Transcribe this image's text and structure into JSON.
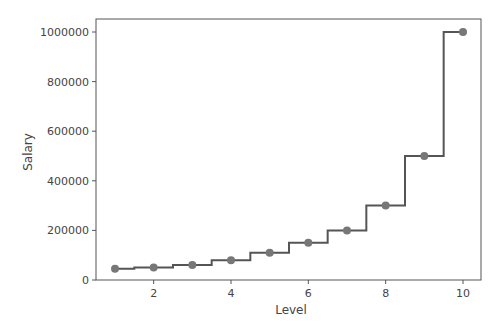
{
  "chart_data": {
    "type": "line",
    "subtype": "step-with-markers",
    "title": "",
    "xlabel": "Level",
    "ylabel": "Salary",
    "x": [
      1,
      2,
      3,
      4,
      5,
      6,
      7,
      8,
      9,
      10
    ],
    "series": [
      {
        "name": "Salary",
        "values": [
          45000,
          50000,
          60000,
          80000,
          110000,
          150000,
          200000,
          300000,
          500000,
          1000000
        ],
        "style": "step-mid line with circle markers"
      }
    ],
    "xticks": [
      2,
      4,
      6,
      8,
      10
    ],
    "yticks": [
      0,
      200000,
      400000,
      600000,
      800000,
      1000000
    ],
    "xtick_labels": [
      "2",
      "4",
      "6",
      "8",
      "10"
    ],
    "ytick_labels": [
      "0",
      "200000",
      "400000",
      "600000",
      "800000",
      "1000000"
    ],
    "xlim": [
      0.55,
      10.45
    ],
    "ylim": [
      0,
      1050000
    ],
    "grid": false,
    "legend": null,
    "colors": {
      "line": "#555555",
      "marker": "#777777",
      "axes": "#555555",
      "text": "#444444"
    }
  }
}
